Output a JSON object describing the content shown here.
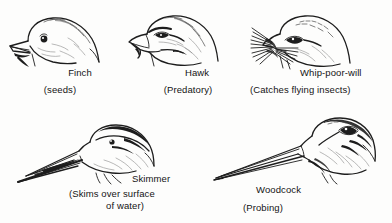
{
  "figure": {
    "background_color": "#fdfdfc",
    "ink_color": "#1d1d1d",
    "width": 392,
    "height": 223
  },
  "birds": [
    {
      "id": "finch",
      "common_name": "Finch",
      "function_note": "(seeds)",
      "beak_type": "short conical seed-cracking bill",
      "facing": "left",
      "row": 1,
      "column": 1
    },
    {
      "id": "hawk",
      "common_name": "Hawk",
      "function_note": "(Predatory)",
      "beak_type": "hooked raptor bill",
      "facing": "left",
      "row": 1,
      "column": 2
    },
    {
      "id": "whip-poor-will",
      "common_name": "Whip-poor-will",
      "function_note": "(Catches flying insects)",
      "beak_type": "wide gape with rictal bristles",
      "facing": "left",
      "row": 1,
      "column": 3
    },
    {
      "id": "skimmer",
      "common_name": "Skimmer",
      "function_note_line1": "(Skims over surface",
      "function_note_line2": "of water)",
      "beak_type": "long blade-like bill, lower mandible longer",
      "facing": "left",
      "row": 2,
      "column": 1
    },
    {
      "id": "woodcock",
      "common_name": "Woodcock",
      "function_note": "(Probing)",
      "beak_type": "very long straight probing bill",
      "facing": "left",
      "row": 2,
      "column": 2
    }
  ]
}
